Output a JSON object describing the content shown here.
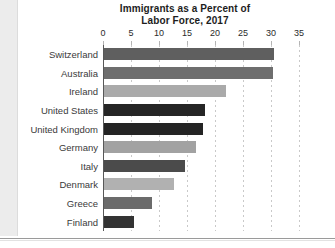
{
  "chart_data": {
    "type": "bar",
    "orientation": "horizontal",
    "title": "Immigrants as a Percent of Labor Force, 2017",
    "title_line1": "Immigrants as a Percent of",
    "title_line2": "Labor Force, 2017",
    "xlabel": "",
    "ylabel": "",
    "xlim": [
      0,
      35
    ],
    "xticks": [
      0,
      5,
      10,
      15,
      20,
      25,
      30,
      35
    ],
    "xtick_labels": [
      "0",
      "5",
      "10",
      "15",
      "20",
      "25",
      "30",
      "35"
    ],
    "grid": "vertical-dotted",
    "legend": "none",
    "categories": [
      "Switzerland",
      "Australia",
      "Ireland",
      "United States",
      "United Kingdom",
      "Germany",
      "Italy",
      "Denmark",
      "Greece",
      "Finland"
    ],
    "values": [
      30.3,
      30.1,
      21.8,
      18.0,
      17.6,
      16.5,
      14.4,
      12.5,
      8.5,
      5.3
    ],
    "bar_colors": [
      "#5f5f5f",
      "#6e6e6e",
      "#aaaaaa",
      "#262626",
      "#242424",
      "#a2a2a2",
      "#4b4b4b",
      "#b1b1b1",
      "#6b6b6b",
      "#333333"
    ]
  },
  "colors": {
    "axis": "#585858",
    "gridline": "#c9c9c9",
    "text": "#2b2b2b",
    "label": "#3a3a3a",
    "background": "#ffffff",
    "page_margin": "#ececec",
    "bottom_rule": "#9a9a9a"
  }
}
